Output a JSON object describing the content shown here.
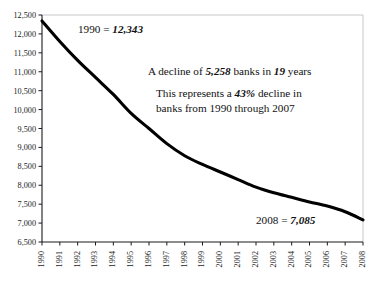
{
  "chart_data": {
    "type": "line",
    "title": "",
    "xlabel": "",
    "ylabel": "",
    "grid": false,
    "legend": "none",
    "ylim": [
      6500,
      12500
    ],
    "ytick_step": 500,
    "categories": [
      "1990",
      "1991",
      "1992",
      "1993",
      "1994",
      "1995",
      "1996",
      "1997",
      "1998",
      "1999",
      "2000",
      "2001",
      "2002",
      "2003",
      "2004",
      "2005",
      "2006",
      "2007",
      "2008"
    ],
    "ytick_labels": [
      "6,500",
      "7,000",
      "7,500",
      "8,000",
      "8,500",
      "9,000",
      "9,500",
      "10,000",
      "10,500",
      "11,000",
      "11,500",
      "12,000",
      "12,500"
    ],
    "series": [
      {
        "name": "Number of banks",
        "values": [
          12343,
          11800,
          11300,
          10850,
          10400,
          9900,
          9500,
          9100,
          8780,
          8550,
          8350,
          8150,
          7950,
          7800,
          7680,
          7560,
          7450,
          7300,
          7085
        ]
      }
    ],
    "annotations": {
      "first_point": {
        "prefix": "1990 = ",
        "value": "12,343"
      },
      "decline": {
        "part1": "A decline of ",
        "value1": "5,258",
        "part2": " banks in ",
        "value2": "19",
        "part3": " years"
      },
      "represents": {
        "line1_part1": "This represents a ",
        "line1_value": "43%",
        "line1_part2": " decline in",
        "line2": "banks from 1990 through 2007"
      },
      "last_point": {
        "prefix": "2008 = ",
        "value": "7,085"
      }
    },
    "colors": {
      "line": "#000000",
      "axis": "#1a1a1a",
      "frame": "#b9b9b9",
      "background": "#ffffff"
    }
  }
}
